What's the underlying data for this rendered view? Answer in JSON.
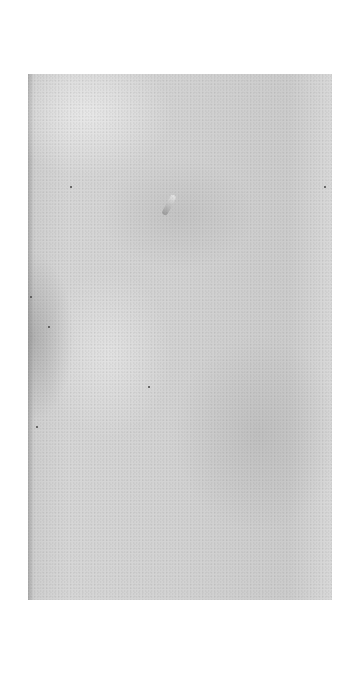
{
  "document": {
    "type": "blank scanned page",
    "text": ""
  }
}
